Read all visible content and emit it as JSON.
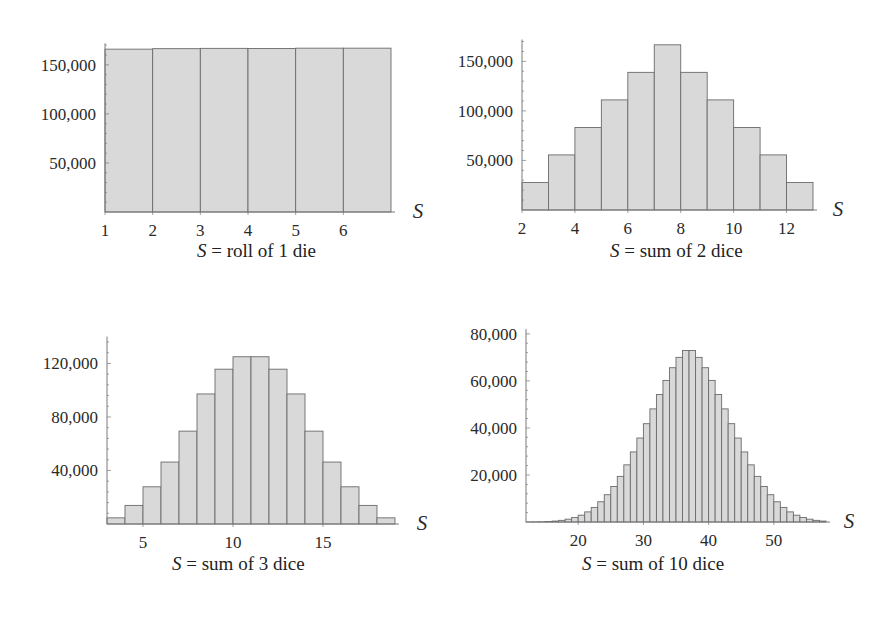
{
  "chart_data": [
    {
      "type": "bar",
      "title": "S = roll of 1 die",
      "caption_var": "S",
      "caption_rest": " = roll of 1 die",
      "xlabel": "S",
      "ylabel": "",
      "categories": [
        1,
        2,
        3,
        4,
        5,
        6
      ],
      "values": [
        166000,
        166500,
        166800,
        166700,
        167000,
        167000
      ],
      "xlim": [
        1,
        7
      ],
      "ylim": [
        0,
        172000
      ],
      "xticks": [
        1,
        2,
        3,
        4,
        5,
        6
      ],
      "xtick_labels": [
        "1",
        "2",
        "3",
        "4",
        "5",
        "6"
      ],
      "yticks": [
        50000,
        100000,
        150000
      ],
      "ytick_labels": [
        "50,000",
        "100,000",
        "150,000"
      ],
      "grid": false,
      "legend": null
    },
    {
      "type": "bar",
      "title": "S = sum of 2 dice",
      "caption_var": "S",
      "caption_rest": " = sum of 2 dice",
      "xlabel": "S",
      "ylabel": "",
      "categories": [
        2,
        3,
        4,
        5,
        6,
        7,
        8,
        9,
        10,
        11,
        12
      ],
      "values": [
        27800,
        55600,
        83300,
        111100,
        138900,
        166700,
        138900,
        111100,
        83300,
        55600,
        27800
      ],
      "xlim": [
        2,
        13
      ],
      "ylim": [
        0,
        172000
      ],
      "xticks": [
        2,
        4,
        6,
        8,
        10,
        12
      ],
      "xtick_labels": [
        "2",
        "4",
        "6",
        "8",
        "10",
        "12"
      ],
      "yticks": [
        50000,
        100000,
        150000
      ],
      "ytick_labels": [
        "50,000",
        "100,000",
        "150,000"
      ],
      "grid": false,
      "legend": null
    },
    {
      "type": "bar",
      "title": "S = sum of 3 dice",
      "caption_var": "S",
      "caption_rest": " = sum of 3 dice",
      "xlabel": "S",
      "ylabel": "",
      "categories": [
        3,
        4,
        5,
        6,
        7,
        8,
        9,
        10,
        11,
        12,
        13,
        14,
        15,
        16,
        17,
        18
      ],
      "values": [
        4600,
        13900,
        27800,
        46300,
        69400,
        97200,
        115700,
        125000,
        125000,
        115700,
        97200,
        69400,
        46300,
        27800,
        13900,
        4600
      ],
      "xlim": [
        3,
        19
      ],
      "ylim": [
        0,
        140000
      ],
      "xticks": [
        5,
        10,
        15
      ],
      "xtick_labels": [
        "5",
        "10",
        "15"
      ],
      "yticks": [
        40000,
        80000,
        120000
      ],
      "ytick_labels": [
        "40,000",
        "80,000",
        "120,000"
      ],
      "grid": false,
      "legend": null
    },
    {
      "type": "bar",
      "title": "S = sum of 10 dice",
      "caption_var": "S",
      "caption_rest": " = sum of 10 dice",
      "xlabel": "S",
      "ylabel": "",
      "categories": [
        12,
        13,
        14,
        15,
        16,
        17,
        18,
        19,
        20,
        21,
        22,
        23,
        24,
        25,
        26,
        27,
        28,
        29,
        30,
        31,
        32,
        33,
        34,
        35,
        36,
        37,
        38,
        39,
        40,
        41,
        42,
        43,
        44,
        45,
        46,
        47,
        48,
        49,
        50,
        51,
        52,
        53,
        54,
        55,
        56,
        57
      ],
      "values": [
        10,
        30,
        80,
        200,
        400,
        700,
        1200,
        1900,
        2900,
        4300,
        6200,
        8600,
        11600,
        15100,
        19400,
        24300,
        29800,
        35700,
        41800,
        48100,
        54200,
        60200,
        65600,
        70000,
        72900,
        72900,
        70000,
        65600,
        60200,
        54200,
        48100,
        41800,
        35700,
        29800,
        24300,
        19400,
        15100,
        11600,
        8600,
        6200,
        4300,
        2900,
        1900,
        1200,
        700,
        400
      ],
      "xlim": [
        12,
        58
      ],
      "ylim": [
        0,
        82000
      ],
      "xticks": [
        20,
        30,
        40,
        50
      ],
      "xtick_labels": [
        "20",
        "30",
        "40",
        "50"
      ],
      "yticks": [
        20000,
        40000,
        60000,
        80000
      ],
      "ytick_labels": [
        "20,000",
        "40,000",
        "60,000",
        "80,000"
      ],
      "grid": false,
      "legend": null
    }
  ],
  "style": {
    "bar_fill": "#d9d9d9",
    "bar_stroke": "#6b6b6b",
    "axis_color": "#7a7a7a",
    "text_color": "#2a2a2a"
  },
  "layout": [
    {
      "x0": 105,
      "x1": 391,
      "y0": 212,
      "ypx_per_unit": 0.000981,
      "caption_x": 257,
      "caption_y": 254,
      "s_x": 418,
      "s_y": 218
    },
    {
      "x0": 522,
      "x1": 813,
      "y0": 210,
      "ypx_per_unit": 0.000991,
      "caption_x": 676,
      "caption_y": 254,
      "s_x": 838,
      "s_y": 216
    },
    {
      "x0": 107,
      "x1": 395,
      "y0": 524,
      "ypx_per_unit": 0.001338,
      "caption_x": 248,
      "caption_y": 567,
      "s_x": 422,
      "s_y": 530
    },
    {
      "x0": 526,
      "x1": 826,
      "y0": 522,
      "ypx_per_unit": 0.002352,
      "caption_x": 679,
      "caption_y": 567,
      "s_x": 849,
      "s_y": 528
    }
  ]
}
